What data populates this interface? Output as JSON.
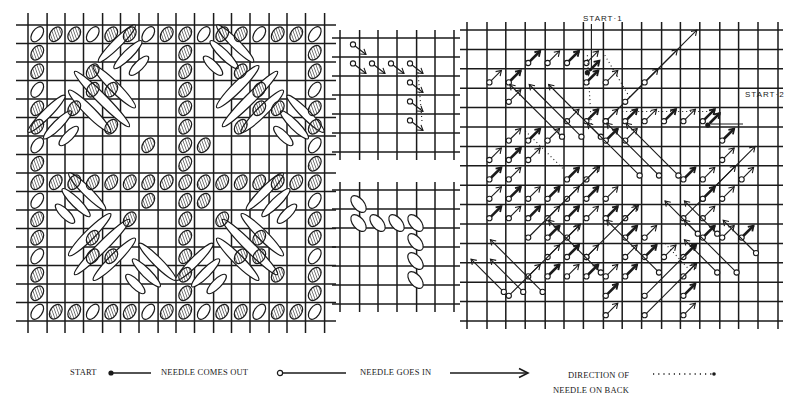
{
  "figure": {
    "panels": [
      {
        "id": "finished-pattern",
        "description": "Completed stitch pattern: diagonal satin stitches forming diamonds, with hatched short stitches between",
        "grid": {
          "x": 28,
          "y": 25,
          "cols": 16,
          "rows": 16,
          "cell": 18.5
        }
      },
      {
        "id": "step-diagram-arrows",
        "description": "Small grid showing first stitches with needle-out circles and arrows",
        "grid": {
          "x": 340,
          "y": 38,
          "cols": 6,
          "rows": 6,
          "cell": 19
        }
      },
      {
        "id": "step-diagram-stitches",
        "description": "Small grid showing the same stitches as worked ovals",
        "grid": {
          "x": 340,
          "y": 190,
          "cols": 6,
          "rows": 6,
          "cell": 19
        }
      },
      {
        "id": "working-diagram",
        "description": "Working diagram with needle-in/needle-out markers and start points",
        "grid": {
          "x": 467,
          "y": 30,
          "cols": 16,
          "rows": 15,
          "cell": 19.4
        },
        "annotations": [
          {
            "label": "START·1",
            "x": 583,
            "y": 20
          },
          {
            "label": "START·2",
            "x": 745,
            "y": 98
          }
        ]
      }
    ],
    "legend": {
      "start": "START",
      "needle_out": "NEEDLE COMES OUT",
      "needle_in": "NEEDLE GOES IN",
      "direction_line1": "DIRECTION OF",
      "direction_line2": "NEEDLE ON BACK"
    },
    "colors": {
      "ink": "#1a1a1a",
      "paper": "#ffffff"
    }
  }
}
